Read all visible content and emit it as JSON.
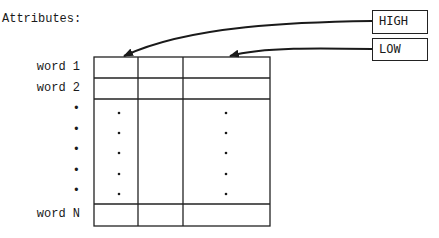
{
  "title": "Attributes:",
  "attribute_boxes": [
    {
      "label": "HIGH"
    },
    {
      "label": "LOW"
    }
  ],
  "rows": [
    {
      "label": "word 1"
    },
    {
      "label": "word 2"
    },
    {
      "label": "•"
    },
    {
      "label": "•"
    },
    {
      "label": "•"
    },
    {
      "label": "•"
    },
    {
      "label": "word N"
    }
  ],
  "columns": 3,
  "ellipsis_dot": "•"
}
